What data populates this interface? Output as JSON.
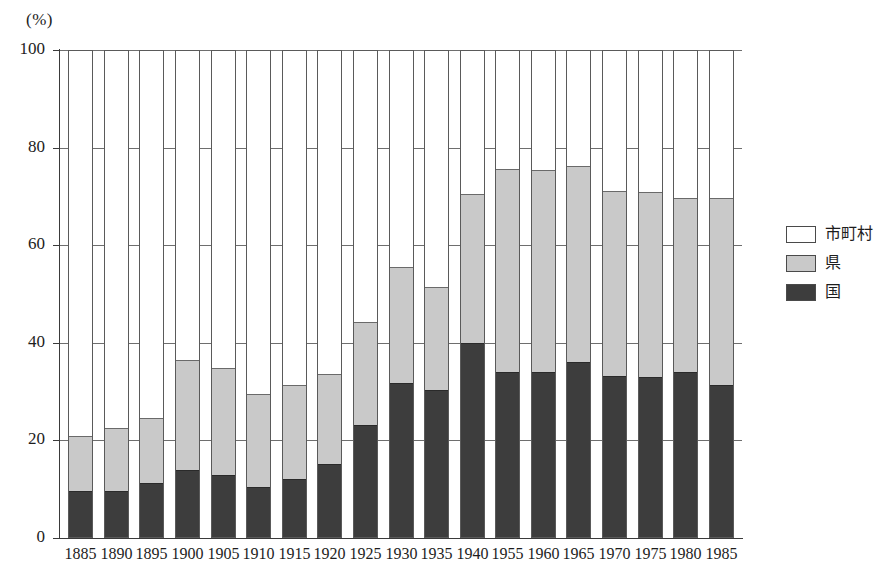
{
  "chart_data": {
    "type": "bar",
    "stacked": true,
    "title": "",
    "xlabel": "",
    "ylabel": "(%)",
    "ylim": [
      0,
      100
    ],
    "yticks": [
      0,
      20,
      40,
      60,
      80,
      100
    ],
    "grid": true,
    "legend_position": "right",
    "categories": [
      "1885",
      "1890",
      "1895",
      "1900",
      "1905",
      "1910",
      "1915",
      "1920",
      "1925",
      "1930",
      "1935",
      "1940",
      "1955",
      "1960",
      "1965",
      "1970",
      "1975",
      "1980",
      "1985"
    ],
    "series": [
      {
        "name": "国",
        "color": "#3d3d3d",
        "values": [
          9.5,
          9.5,
          11.0,
          13.8,
          12.8,
          10.3,
          11.8,
          15.0,
          23.0,
          31.5,
          30.2,
          39.7,
          33.8,
          33.8,
          35.8,
          33.0,
          32.8,
          33.8,
          31.2
        ]
      },
      {
        "name": "県",
        "color": "#c9c9c9",
        "values": [
          11.2,
          12.8,
          13.4,
          22.5,
          21.9,
          19.0,
          19.4,
          18.5,
          21.0,
          23.8,
          21.0,
          30.5,
          41.7,
          41.5,
          40.2,
          38.0,
          37.8,
          35.6,
          38.3
        ]
      },
      {
        "name": "市町村",
        "color": "#ffffff",
        "values": [
          79.3,
          77.7,
          75.6,
          63.7,
          65.3,
          70.7,
          68.8,
          66.5,
          56.0,
          44.7,
          48.8,
          29.8,
          24.5,
          24.7,
          24.0,
          29.0,
          29.4,
          30.6,
          30.5
        ]
      }
    ],
    "totals_visible": [
      20.7,
      22.3,
      24.4,
      36.3,
      34.7,
      29.3,
      31.2,
      33.5,
      44.0,
      55.3,
      51.2,
      70.2,
      75.5,
      75.3,
      76.0,
      71.0,
      70.6,
      69.4,
      69.5
    ]
  },
  "axis": {
    "unit_label": "(%)",
    "y_tick_labels": [
      "100",
      "80",
      "60",
      "40",
      "20",
      "0"
    ],
    "x_tick_labels": [
      "1885",
      "1890",
      "1895",
      "1900",
      "1905",
      "1910",
      "1915",
      "1920",
      "1925",
      "1930",
      "1935",
      "1940",
      "1955",
      "1960",
      "1965",
      "1970",
      "1975",
      "1980",
      "1985"
    ]
  },
  "legend": {
    "items": [
      {
        "label": "市町村",
        "swatch": "white-swatch"
      },
      {
        "label": "県",
        "swatch": "gray-swatch"
      },
      {
        "label": "国",
        "swatch": "dark-swatch"
      }
    ]
  }
}
